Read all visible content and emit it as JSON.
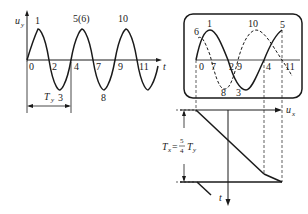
{
  "left_plot": {
    "y_axis_label": "u",
    "y_axis_sub": "y",
    "x_axis_label": "t",
    "top_labels": [
      "1",
      "5(6)",
      "10"
    ],
    "axis_labels": [
      "0",
      "2",
      "4",
      "7",
      "9",
      "11"
    ],
    "bottom_labels": [
      "3",
      "8"
    ],
    "period_label": "T",
    "period_sub": "y"
  },
  "screen": {
    "top_labels": [
      "6",
      "1",
      "10",
      "5"
    ],
    "axis_labels": [
      "0",
      "7",
      "2",
      "9",
      "4",
      "11"
    ],
    "bottom_labels": [
      "8",
      "3"
    ]
  },
  "sweep": {
    "x_axis_label": "u",
    "x_axis_sub": "x",
    "t_axis_label": "t",
    "formula_lhs": "T",
    "formula_lhs_sub": "x",
    "formula_eq": "=",
    "formula_num": "5",
    "formula_den": "4",
    "formula_rhs": "T",
    "formula_rhs_sub": "y"
  },
  "colors": {
    "stroke": "#1a1a1a",
    "background": "#ffffff"
  }
}
